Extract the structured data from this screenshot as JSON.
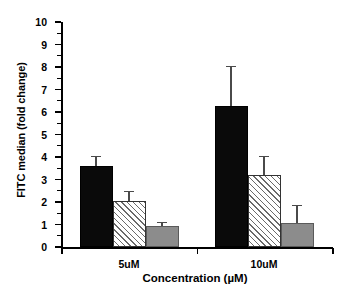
{
  "chart_data": {
    "type": "bar",
    "title": "",
    "subtitle": "",
    "xlabel": "Concentration (µM)",
    "ylabel": "FITC median (fold change)",
    "categories": [
      "5uM",
      "10uM"
    ],
    "ylim": [
      0,
      10
    ],
    "ytick_labels": [
      "0",
      "1",
      "2",
      "3",
      "4",
      "5",
      "6",
      "7",
      "8",
      "9",
      "10"
    ],
    "ytick_values": [
      0,
      1,
      2,
      3,
      4,
      5,
      6,
      7,
      8,
      9,
      10
    ],
    "y_minor_ticks": true,
    "y_minor_step": 0.5,
    "grid": false,
    "legend": "none",
    "legend_entries": [],
    "annotations": [],
    "series": [
      {
        "name": "black",
        "fill": "solid-black",
        "color": "#0a0a0a",
        "values": [
          3.6,
          6.25
        ],
        "errors": [
          0.45,
          1.8
        ]
      },
      {
        "name": "hatched",
        "fill": "diagonal-hatch",
        "color": "#ffffff",
        "values": [
          2.05,
          3.2
        ],
        "errors": [
          0.45,
          0.85
        ]
      },
      {
        "name": "gray",
        "fill": "solid-gray",
        "color": "#8c8c8c",
        "values": [
          0.95,
          1.07
        ],
        "errors": [
          0.18,
          0.8
        ]
      }
    ]
  },
  "colors": {
    "background": "#ffffff",
    "axis": "#000000",
    "text": "#000000",
    "bar_black": "#0a0a0a",
    "bar_hatch_bg": "#ffffff",
    "bar_hatch_line": "#6a6a6a",
    "bar_gray": "#8c8c8c",
    "error_bar": "#4a4a4a"
  }
}
